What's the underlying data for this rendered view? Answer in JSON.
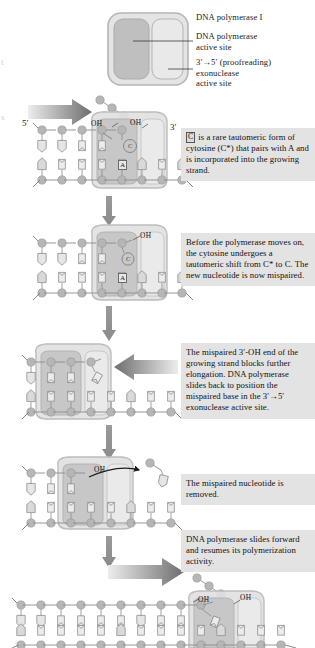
{
  "figure": {
    "type": "biology-process-diagram"
  },
  "legend": {
    "enzyme_name": "DNA polymerase I",
    "site_1": "DNA polymerase\nactive site",
    "site_1_line1": "DNA polymerase",
    "site_1_line2": "active site",
    "site_2_line1": "3′→5′ (proofreading)",
    "site_2_line2": "exonuclease",
    "site_2_line3": "active site"
  },
  "steps": [
    {
      "id": "step-1",
      "badge": "C",
      "text": " is a rare tautomeric form of cytosine (C*) that pairs with A and is incorporated into the growing strand."
    },
    {
      "id": "step-2",
      "badge": "",
      "text": "Before the polymerase moves on, the cytosine undergoes a tautomeric shift from C* to C. The new nucleotide is now mispaired."
    },
    {
      "id": "step-3",
      "badge": "",
      "text": "The mispaired 3′-OH end of the growing strand blocks further elongation.  DNA polymerase slides back to position the mispaired base in the 3′→5′  exonuclease active site."
    },
    {
      "id": "step-4",
      "badge": "",
      "text": "The mispaired nucleotide is removed."
    },
    {
      "id": "step-5",
      "badge": "",
      "text": "DNA polymerase slides forward and resumes its polymerization activity."
    }
  ],
  "strand_labels": {
    "five_prime": "5′",
    "three_prime": "3′",
    "hydroxyl": "OH"
  },
  "base_tags": {
    "adenine": "A",
    "cytosine_tautomer": "C"
  },
  "colors": {
    "enzyme_outline": "#b9b9b9",
    "enzyme_body": "#dedede",
    "polymerase_lobe": "#bdbdbd",
    "exonuclease_lobe": "#e2e2e2",
    "backbone_circle": "#b4b4b4",
    "base_fill": "#e6e6e6",
    "base_outline": "#8e8e8e",
    "textbox_bg": "#e3e3e3",
    "arrow_dark": "#6f6f6f",
    "arrow_light": "#e8e8e8",
    "text": "#1a1a1a"
  }
}
